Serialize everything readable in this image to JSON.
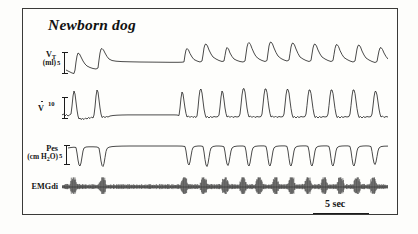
{
  "figure": {
    "title": "Newborn dog",
    "frame_color": "#3a3a38",
    "trace_color": "#1d1d1d",
    "background": "#fefefc"
  },
  "time_scale": {
    "label": "5 sec",
    "bar_length_px": 56,
    "seconds": 5
  },
  "channels": [
    {
      "id": "vt",
      "label": "V",
      "sublabel": "T",
      "unit": "(ml)",
      "scale_value": "5",
      "description": "tidal volume"
    },
    {
      "id": "flow",
      "label": "V",
      "sublabel": "",
      "unit": "",
      "scale_value": "10",
      "description": "airflow"
    },
    {
      "id": "pes",
      "label": "Pes",
      "sublabel": "",
      "unit": "(cm H2O)",
      "scale_value": "5",
      "description": "esophageal pressure"
    },
    {
      "id": "emgdi",
      "label": "EMGdi",
      "sublabel": "",
      "unit": "",
      "scale_value": "",
      "description": "diaphragm electromyogram"
    }
  ],
  "chart_data": {
    "type": "line",
    "title": "Newborn dog",
    "xlabel": "time",
    "ylabel": "",
    "x_scale_bar_seconds": 5,
    "grid": false,
    "legend": "none",
    "series": [
      {
        "name": "VT (ml)",
        "scale_bar": 5,
        "unit": "ml",
        "description": "Tidal volume: breath-by-breath excursions, an apneic pause mid-record, then regular rhythmic breathing",
        "breath_peak_times_rel": [
          0.04,
          0.13,
          0.38,
          0.44,
          0.5,
          0.56,
          0.61,
          0.66,
          0.71,
          0.76,
          0.81,
          0.86,
          0.91,
          0.96
        ],
        "breath_peak_amplitudes": [
          5.0,
          6.0,
          4.4,
          5.6,
          4.2,
          7.2,
          7.4,
          7.0,
          6.6,
          6.4,
          6.2,
          6.2,
          6.0,
          5.4
        ],
        "apnea_window_rel": [
          0.16,
          0.36
        ]
      },
      {
        "name": "V-dot (flow)",
        "scale_bar": 10,
        "unit": "ml/s",
        "description": "Airflow: sharp inspiratory spikes upward, expiratory undershoot, zero-flow during apnea",
        "spike_times_rel": [
          0.03,
          0.12,
          0.37,
          0.43,
          0.49,
          0.55,
          0.6,
          0.65,
          0.7,
          0.75,
          0.8,
          0.85,
          0.9,
          0.955
        ],
        "spike_amplitudes": [
          9.5,
          10.5,
          7.5,
          10.0,
          7.0,
          11.5,
          11.0,
          10.5,
          10.5,
          10.0,
          10.0,
          10.0,
          10.0,
          9.0
        ],
        "apnea_window_rel": [
          0.16,
          0.36
        ]
      },
      {
        "name": "Pes (cm H2O)",
        "scale_bar": 5,
        "unit": "cm H2O",
        "description": "Esophageal pressure: negative (downward) swings with each inspiration, flat during apnea",
        "deflection_times_rel": [
          0.04,
          0.13,
          0.375,
          0.435,
          0.5,
          0.555,
          0.605,
          0.655,
          0.705,
          0.755,
          0.805,
          0.855,
          0.905,
          0.955
        ],
        "deflection_amplitudes": [
          -5.0,
          -5.4,
          -4.0,
          -5.2,
          -4.6,
          -6.0,
          -6.2,
          -6.0,
          -5.8,
          -5.6,
          -5.4,
          -5.4,
          -5.2,
          -4.4
        ],
        "apnea_window_rel": [
          0.16,
          0.36
        ]
      },
      {
        "name": "EMGdi",
        "scale_bar": null,
        "unit": "arbitrary",
        "description": "Diaphragm EMG: continuous dense high-frequency activity with periodic large bursts coinciding with inspirations",
        "burst_times_rel": [
          0.035,
          0.125,
          0.375,
          0.435,
          0.5,
          0.555,
          0.605,
          0.655,
          0.705,
          0.755,
          0.805,
          0.855,
          0.905,
          0.955
        ]
      }
    ]
  }
}
